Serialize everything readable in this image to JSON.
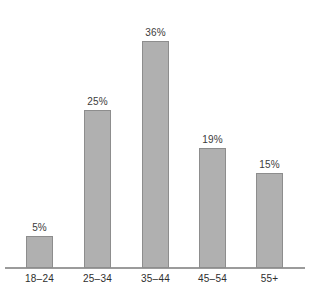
{
  "chart_data": {
    "type": "bar",
    "title": "",
    "subtitle": "",
    "xlabel": "",
    "ylabel": "",
    "categories": [
      "18–24",
      "25–34",
      "35–44",
      "45–54",
      "55+"
    ],
    "values": [
      5,
      25,
      36,
      19,
      15
    ],
    "value_labels": [
      "5%",
      "25%",
      "36%",
      "19%",
      "15%"
    ],
    "ylim": [
      0,
      36
    ],
    "grid": false,
    "legend": false,
    "y_axis_visible": false,
    "x_axis_visible": true,
    "colors": {
      "bar_fill": "#b0b0b0",
      "bar_border": "#8d8d8d",
      "axis_line": "#9b9b9b",
      "value_text": "#3b3b3b",
      "category_text": "#2e2e2e",
      "background": "#ffffff"
    }
  }
}
